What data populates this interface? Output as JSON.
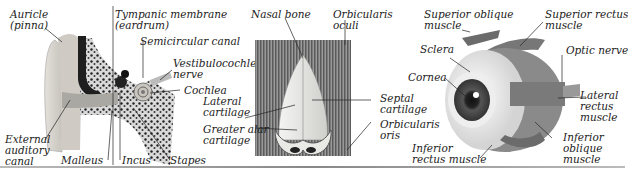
{
  "figures": {
    "ear": {
      "name": "Ear",
      "labels": {
        "auricle": "Auricle\n(pinna)",
        "tympanic": "Tympanic membrane\n(eardrum)",
        "semicircular": "Semicircular canal",
        "vestibulocochlear": "Vestibulocochlear\nnerve",
        "cochlea": "Cochlea",
        "external_canal": "External\nauditory\ncanal",
        "malleus": "Malleus",
        "incus": "Incus",
        "stapes": "Stapes"
      }
    },
    "nose": {
      "name": "Nose",
      "labels": {
        "nasal_bone": "Nasal bone",
        "orbicularis_oculi": "Orbicularis\noculi",
        "lateral_cartilage": "Lateral\ncartilage",
        "greater_alar": "Greater alar\ncartilage",
        "septal_cartilage": "Septal\ncartilage",
        "orbicularis_oris": "Orbicularis\noris"
      }
    },
    "eye": {
      "name": "Eye",
      "labels": {
        "superior_oblique": "Superior oblique\nmuscle",
        "superior_rectus": "Superior rectus\nmuscle",
        "sclera": "Sclera",
        "optic_nerve": "Optic nerve",
        "cornea": "Cornea",
        "lateral_rectus": "Lateral\nrectus\nmuscle",
        "inferior_oblique": "Inferior\noblique\nmuscle",
        "inferior_rectus": "Inferior\nrectus muscle"
      }
    }
  },
  "colors": {
    "ear_skin": "#c8c4bc",
    "bone": "#3a3a3a",
    "eye_muscle": "#6b6b6b",
    "text": "#222222"
  }
}
